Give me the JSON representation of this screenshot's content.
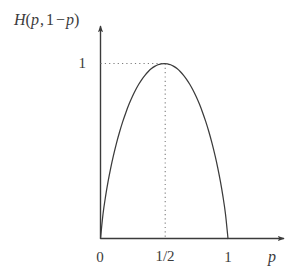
{
  "figure": {
    "title": "",
    "background_color": "#ffffff",
    "line_color": "#3b3b3b",
    "text_color": "#3b3b3b",
    "width": 303,
    "height": 280
  },
  "axes": {
    "y_caption": {
      "full": "H(p,1-p)",
      "function_name": "H",
      "open_paren": "(",
      "arg1": "p",
      "comma": ",",
      "one": "1",
      "minus": "−",
      "arg2": "p",
      "close_paren": ")"
    },
    "x_caption": "p",
    "y_ticks": [
      {
        "label": "1",
        "value": 1
      }
    ],
    "x_ticks": [
      {
        "label": "0",
        "value": 0
      },
      {
        "label": "1/2",
        "value": 0.5
      },
      {
        "label": "1",
        "value": 1
      }
    ]
  },
  "annotations": {
    "guide_horizontal": "dotted line from y-axis to curve peak at H = 1",
    "guide_vertical": "dotted line from curve peak down to x-axis at p = 1/2"
  },
  "chart_data": {
    "type": "line",
    "title": "",
    "xlabel": "p",
    "ylabel": "H(p,1-p)",
    "xlim": [
      0,
      1
    ],
    "ylim": [
      0,
      1
    ],
    "grid": false,
    "legend": null,
    "xticks": [
      0,
      0.5,
      1
    ],
    "xticklabels": [
      "0",
      "1/2",
      "1"
    ],
    "yticks": [
      1
    ],
    "yticklabels": [
      "1"
    ],
    "series": [
      {
        "name": "binary entropy",
        "formula": "H(p) = -p*log2(p) - (1-p)*log2(1-p)",
        "x": [
          0,
          0.02,
          0.04,
          0.06,
          0.08,
          0.1,
          0.125,
          0.15,
          0.175,
          0.2,
          0.225,
          0.25,
          0.275,
          0.3,
          0.325,
          0.35,
          0.375,
          0.4,
          0.425,
          0.45,
          0.475,
          0.5,
          0.525,
          0.55,
          0.575,
          0.6,
          0.625,
          0.65,
          0.675,
          0.7,
          0.725,
          0.75,
          0.775,
          0.8,
          0.825,
          0.85,
          0.875,
          0.9,
          0.92,
          0.94,
          0.96,
          0.98,
          1
        ],
        "y": [
          0,
          0.1414,
          0.2423,
          0.3274,
          0.4022,
          0.469,
          0.5436,
          0.6098,
          0.669,
          0.7219,
          0.7695,
          0.8113,
          0.8485,
          0.8813,
          0.9097,
          0.9341,
          0.9544,
          0.971,
          0.9837,
          0.9928,
          0.9982,
          1.0,
          0.9982,
          0.9928,
          0.9837,
          0.971,
          0.9544,
          0.9341,
          0.9097,
          0.8813,
          0.8485,
          0.8113,
          0.7695,
          0.7219,
          0.669,
          0.6098,
          0.5436,
          0.469,
          0.4022,
          0.3274,
          0.2423,
          0.1414,
          0
        ]
      }
    ],
    "annotations": [
      {
        "type": "dotted-hline",
        "y": 1,
        "x_from": 0,
        "x_to": 0.5
      },
      {
        "type": "dotted-vline",
        "x": 0.5,
        "y_from": 0,
        "y_to": 1
      }
    ]
  }
}
